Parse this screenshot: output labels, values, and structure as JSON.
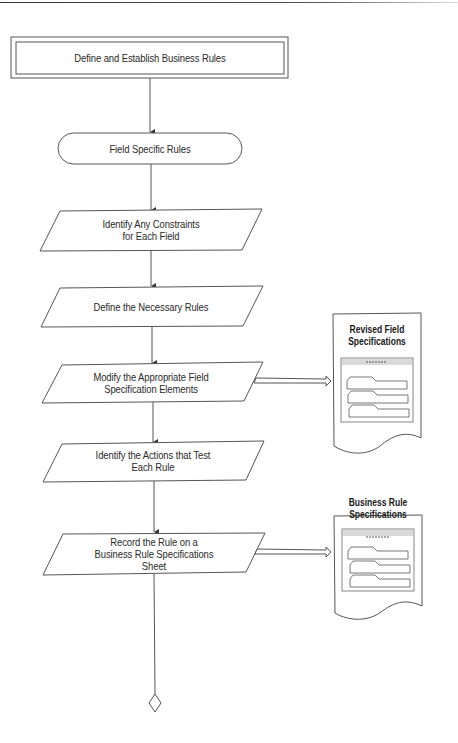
{
  "diagram": {
    "type": "flowchart",
    "colors": {
      "stroke": "#555555",
      "text": "#2a2a2a",
      "form_header": "#d9d9d9"
    },
    "nodes": [
      {
        "id": "start",
        "shape": "double-rectangle",
        "label": "Define and Establish Business Rules"
      },
      {
        "id": "field-specific-rules",
        "shape": "terminator",
        "label": "Field Specific Rules"
      },
      {
        "id": "identify-constraints",
        "shape": "parallelogram",
        "lines": [
          "Identify Any Constraints",
          "for Each Field"
        ]
      },
      {
        "id": "define-rules",
        "shape": "parallelogram",
        "lines": [
          "Define the Necessary Rules"
        ]
      },
      {
        "id": "modify-elements",
        "shape": "parallelogram",
        "lines": [
          "Modify the Appropriate Field",
          "Specification Elements"
        ]
      },
      {
        "id": "identify-actions",
        "shape": "parallelogram",
        "lines": [
          "Identify the Actions that Test",
          "Each Rule"
        ]
      },
      {
        "id": "record-rule",
        "shape": "parallelogram",
        "lines": [
          "Record the Rule on a",
          "Business Rule Specifications",
          "Sheet"
        ]
      },
      {
        "id": "connector",
        "shape": "diamond",
        "label": ""
      }
    ],
    "documents": [
      {
        "id": "revised-field-specs",
        "lines": [
          "Revised Field",
          "Specifications"
        ],
        "linked_from": "modify-elements"
      },
      {
        "id": "business-rule-specs",
        "lines": [
          "Business Rule",
          "Specifications"
        ],
        "linked_from": "record-rule"
      }
    ]
  }
}
